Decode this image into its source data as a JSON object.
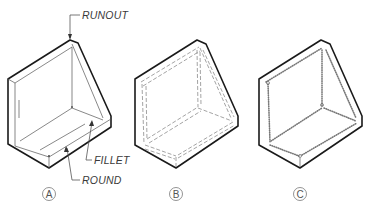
{
  "figure": {
    "type": "isometric technical drawing of an angle bracket with gusset showing fillets, rounds and runouts",
    "labels": {
      "runout": "RUNOUT",
      "fillet": "FILLET",
      "round": "ROUND"
    },
    "views": [
      {
        "id": "A",
        "caption": "A",
        "style": "runout lines"
      },
      {
        "id": "B",
        "caption": "B",
        "style": "double dashed tangent lines"
      },
      {
        "id": "C",
        "caption": "C",
        "style": "stippled / dotted tangent edges"
      }
    ],
    "colors": {
      "line": "#1a1a1a",
      "thin_line": "#555555",
      "label": "#3a3a3a",
      "background": "#ffffff"
    }
  }
}
